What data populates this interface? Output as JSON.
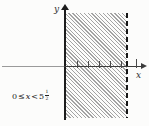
{
  "figure": {
    "type": "inequality-region-plot",
    "description_visible": "Region of the plane shaded with diagonal hatching between the y-axis (solid boundary, included) and a dashed vertical line (excluded)",
    "axes": {
      "x_label": "x",
      "y_label": "y"
    },
    "inequality": {
      "left_operand": "0",
      "leq_symbol": "≤",
      "variable": "x",
      "lt_symbol": "<",
      "integer_part": "5",
      "fraction_numerator": "1",
      "fraction_denominator": "2"
    },
    "region": {
      "x_min": 0,
      "x_max": 5.5,
      "x_min_boundary": "solid-included",
      "x_max_boundary": "dashed-excluded",
      "hatch_direction": "backslash-diagonal"
    },
    "x_ticks_units": [
      1,
      2,
      3,
      4,
      5,
      6
    ],
    "colors": {
      "background": "#fcfcfb",
      "solid_boundary": "#1c1c1c",
      "dashed_boundary": "#161616",
      "axis_negative_side": "#9a9a9a",
      "axis_positive_side": "#3c3c3c",
      "hatch": "#a3a3a3",
      "text": "#222222"
    }
  }
}
